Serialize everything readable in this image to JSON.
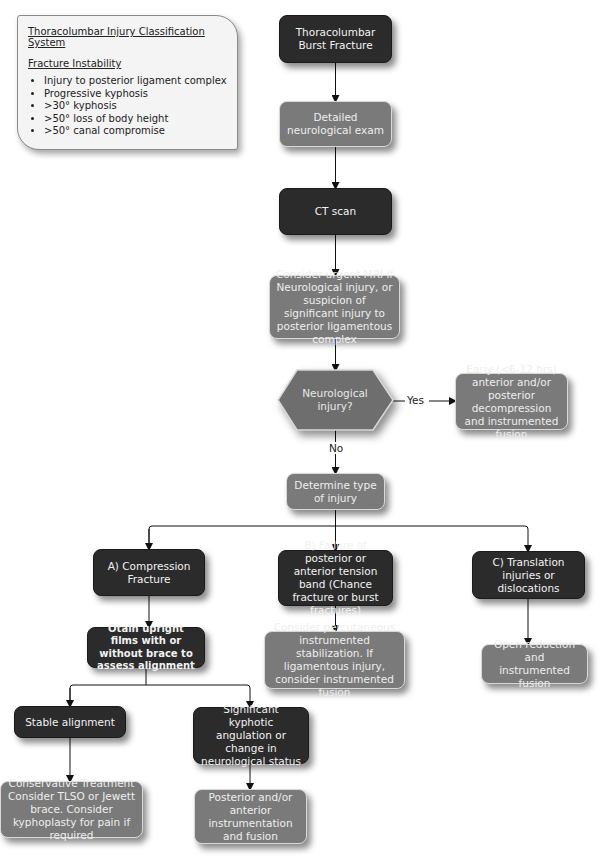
{
  "info_box": {
    "title": "Thoracolumbar Injury Classification System",
    "subtitle": "Fracture Instability",
    "items": [
      "Injury to posterior ligament complex",
      "Progressive kyphosis",
      ">30° kyphosis",
      ">50° loss of body height",
      ">50° canal compromise"
    ]
  },
  "nodes": {
    "burst_fracture": "Thoracolumbar Burst Fracture",
    "neuro_exam": "Detailed neurological exam",
    "ct_scan": "CT scan",
    "mri": "Consider urgent MRI if Neurological injury, or suspicion of significant injury to posterior ligamentous complex",
    "neuro_injury_decision": "Neurological injury?",
    "early_decompression": "Early (<6-12 hrs) anterior and/or posterior decompression and instrumented fusion",
    "determine_type": "Determine type of injury",
    "compression": "A) Compression Fracture",
    "upright_films": "Otain upright films with or without brace to assess alignment",
    "tension_band": "B) Failure of posterior or anterior tension band (Chance fracture or burst fractures)",
    "percutaneous": "Consider percutaneous instrumented stabilization. If ligamentous injury, consider instrumented fusion",
    "translation": "C) Translation injuries or dislocations",
    "open_reduction": "Open reduction and instrumented fusion",
    "stable": "Stable alignment",
    "kyphotic": "Significant kyphotic angulation or change in neurological status",
    "conservative": "Conservative Treatment Consider TLSO or Jewett brace. Consider kyphoplasty for pain if required",
    "posterior_anterior": "Posterior and/or anterior instrumentation and fusion"
  },
  "edge_labels": {
    "yes": "Yes",
    "no": "No"
  },
  "colors": {
    "dark_box": "#2b2b2b",
    "gray_box": "#7a7a7a",
    "info_bg": "#f4f4f4",
    "line": "#111111"
  }
}
